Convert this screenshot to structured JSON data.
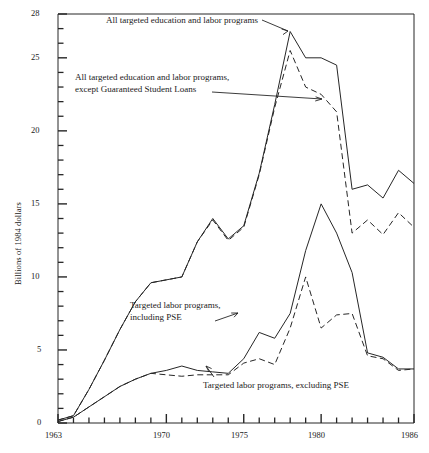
{
  "chart_data": {
    "type": "line",
    "title": "",
    "xlabel": "",
    "ylabel": "Billions of 1984 dollars",
    "xlim": [
      1963,
      1986
    ],
    "ylim": [
      0,
      28
    ],
    "grid": false,
    "legend_position": "inline-annotations",
    "x_ticks_major": [
      "1963",
      "1970",
      "1975",
      "1980",
      "1986"
    ],
    "x_tick_values": [
      1963,
      1970,
      1975,
      1980,
      1986
    ],
    "x_minor_tick_interval": 1,
    "y_ticks_major": [
      "0",
      "5",
      "10",
      "15",
      "20",
      "25",
      "28"
    ],
    "y_tick_values": [
      0,
      5,
      10,
      15,
      20,
      25,
      28
    ],
    "y_minor_tick_interval": 1,
    "x": [
      1963,
      1964,
      1965,
      1966,
      1967,
      1968,
      1969,
      1970,
      1971,
      1972,
      1973,
      1974,
      1975,
      1976,
      1977,
      1978,
      1979,
      1980,
      1981,
      1982,
      1983,
      1984,
      1985,
      1986
    ],
    "series": [
      {
        "name": "All targeted education and labor programs",
        "style": "solid",
        "color": "#262626",
        "values": [
          0.2,
          0.5,
          2.3,
          4.3,
          6.4,
          8.3,
          9.6,
          9.8,
          10.0,
          12.4,
          14.0,
          12.6,
          13.5,
          17.1,
          21.8,
          26.8,
          25.0,
          25.0,
          24.5,
          16.0,
          16.3,
          15.4,
          17.3,
          16.4
        ]
      },
      {
        "name": "All targeted education and labor programs, except Guaranteed Student Loans",
        "style": "dashed",
        "color": "#262626",
        "values": [
          0.2,
          0.5,
          2.3,
          4.3,
          6.4,
          8.3,
          9.6,
          9.8,
          10.0,
          12.4,
          13.9,
          12.5,
          13.4,
          17.0,
          21.6,
          25.5,
          23.0,
          22.5,
          21.3,
          13.0,
          13.9,
          12.9,
          14.4,
          13.4
        ]
      },
      {
        "name": "Targeted labor programs, including PSE",
        "style": "solid",
        "color": "#262626",
        "values": [
          0.1,
          0.4,
          1.1,
          1.8,
          2.5,
          3.0,
          3.4,
          3.6,
          3.9,
          3.6,
          3.5,
          3.4,
          4.4,
          6.2,
          5.8,
          7.5,
          11.8,
          15.0,
          13.0,
          10.3,
          4.8,
          4.5,
          3.7,
          3.7
        ]
      },
      {
        "name": "Targeted labor programs, excluding PSE",
        "style": "dashed",
        "color": "#262626",
        "values": [
          0.1,
          0.4,
          1.1,
          1.8,
          2.5,
          3.0,
          3.4,
          3.3,
          3.2,
          3.3,
          3.3,
          3.3,
          4.1,
          4.4,
          4.0,
          6.5,
          10.0,
          6.5,
          7.4,
          7.5,
          4.6,
          4.4,
          3.6,
          3.7
        ]
      }
    ],
    "annotations": [
      {
        "id": "annot-all-programs",
        "lines": [
          "All targeted education and labor programs"
        ],
        "text": "All targeted education and labor programs"
      },
      {
        "id": "annot-all-except-gsl",
        "lines": [
          "All targeted education and labor programs,",
          "except Guaranteed Student Loans"
        ],
        "text": "All targeted education and labor programs, except Guaranteed Student Loans"
      },
      {
        "id": "annot-labor-including-pse",
        "lines": [
          "Targeted labor programs,",
          "including PSE"
        ],
        "text": "Targeted labor programs, including PSE"
      },
      {
        "id": "annot-labor-excluding-pse",
        "lines": [
          "Targeted labor programs, excluding PSE"
        ],
        "text": "Targeted labor programs, excluding PSE"
      }
    ]
  },
  "axis": {
    "ylabel": "Billions of 1984 dollars",
    "y_labels": {
      "v28": "28",
      "v25": "25",
      "v20": "20",
      "v15": "15",
      "v10": "10",
      "v5": "5",
      "v0": "0"
    },
    "x_labels": {
      "v1963": "1963",
      "v1970": "1970",
      "v1975": "1975",
      "v1980": "1980",
      "v1986": "1986"
    }
  },
  "annotations": {
    "all_programs": "All targeted education and labor programs",
    "except_gsl_line1": "All targeted education and labor programs,",
    "except_gsl_line2": "except Guaranteed Student Loans",
    "labor_incl_pse_line1": "Targeted labor programs,",
    "labor_incl_pse_line2": "including PSE",
    "labor_excl_pse": "Targeted labor programs, excluding PSE"
  }
}
